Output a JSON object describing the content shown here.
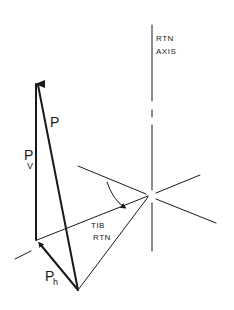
{
  "diagram": {
    "axis_label_line1": "RTN",
    "axis_label_line2": "AXIS",
    "vector_p": "P",
    "vector_pv_main": "P",
    "vector_pv_sub": "V",
    "vector_ph_main": "P",
    "vector_ph_sub": "h",
    "angle_label_line1": "TIB",
    "angle_label_line2": "RTN"
  }
}
